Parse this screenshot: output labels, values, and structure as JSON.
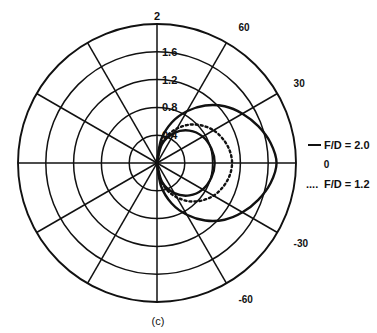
{
  "figure": {
    "caption": "(c)",
    "center": {
      "x": 157,
      "y": 163
    },
    "outer_radius": 139
  },
  "legend": {
    "entries": [
      {
        "label": "F/D = 2.0",
        "style": "solid",
        "marker": "__"
      },
      {
        "label": "F/D = 1.2",
        "style": "dotted",
        "marker": "...."
      }
    ]
  },
  "chart_data": {
    "type": "line",
    "subtype": "polar",
    "title": "",
    "caption": "(c)",
    "xlabel": "",
    "ylabel": "",
    "grid": true,
    "legend_position": "right",
    "angle_unit": "degrees",
    "angle_range": [
      -90,
      90
    ],
    "angle_tick_labels": [
      "60",
      "30",
      "0",
      "-30",
      "-60"
    ],
    "angle_ticks": [
      60,
      30,
      0,
      -30,
      -60
    ],
    "radial_tick_labels": [
      "0.4",
      "0.8",
      "1.2",
      "1.6",
      "2"
    ],
    "radial_ticks": [
      0.4,
      0.8,
      1.2,
      1.6,
      2.0
    ],
    "rlim": [
      0,
      2.0
    ],
    "spoke_interval_deg": 30,
    "ring_count": 5,
    "series": [
      {
        "name": "F/D = 2.0",
        "style": "solid",
        "color": "#111111",
        "theta": [
          -90,
          -80,
          -70,
          -60,
          -50,
          -40,
          -30,
          -20,
          -10,
          0,
          10,
          20,
          30,
          40,
          50,
          60,
          70,
          80,
          90
        ],
        "r": [
          0.0,
          0.34,
          0.62,
          0.86,
          1.08,
          1.27,
          1.42,
          1.55,
          1.66,
          1.72,
          1.66,
          1.55,
          1.42,
          1.27,
          1.08,
          0.86,
          0.62,
          0.34,
          0.0
        ]
      },
      {
        "name": "F/D = 1.2",
        "style": "dotted",
        "color": "#111111",
        "theta": [
          -90,
          -80,
          -70,
          -60,
          -50,
          -40,
          -30,
          -20,
          -10,
          0,
          10,
          20,
          30,
          40,
          50,
          60,
          70,
          80,
          90
        ],
        "r": [
          0.0,
          0.22,
          0.41,
          0.57,
          0.72,
          0.84,
          0.94,
          1.01,
          1.06,
          1.08,
          1.06,
          1.01,
          0.94,
          0.84,
          0.72,
          0.57,
          0.41,
          0.22,
          0.0
        ]
      },
      {
        "name": "F/D = 2.0 inner lobe",
        "style": "solid",
        "color": "#111111",
        "theta": [
          -90,
          -75,
          -60,
          -45,
          -30,
          -15,
          0,
          15,
          30,
          45,
          60,
          75,
          90
        ],
        "r": [
          0.0,
          0.28,
          0.5,
          0.66,
          0.76,
          0.81,
          0.83,
          0.81,
          0.76,
          0.66,
          0.5,
          0.28,
          0.0
        ]
      }
    ]
  }
}
